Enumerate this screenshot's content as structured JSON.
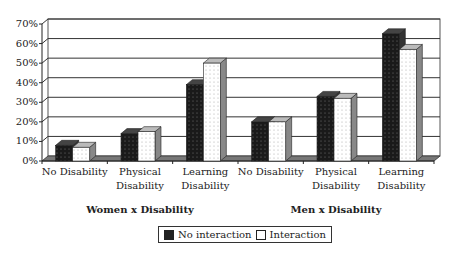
{
  "chart_data": {
    "type": "bar",
    "title": "",
    "xlabel": "",
    "ylabel": "",
    "ylim": [
      0,
      70
    ],
    "yticks": [
      "0%",
      "10%",
      "20%",
      "30%",
      "40%",
      "50%",
      "60%",
      "70%"
    ],
    "grid": true,
    "legend_position": "bottom",
    "categories": [
      "No Disability",
      "Physical Disability",
      "Learning Disability",
      "No Disability",
      "Physical Disability",
      "Learning Disability"
    ],
    "category_lines": [
      [
        "No Disability"
      ],
      [
        "Physical",
        "Disability"
      ],
      [
        "Learning",
        "Disability"
      ],
      [
        "No Disability"
      ],
      [
        "Physical",
        "Disability"
      ],
      [
        "Learning",
        "Disability"
      ]
    ],
    "groups": [
      "Women x Disability",
      "Men x Disability"
    ],
    "series": [
      {
        "name": "No interaction",
        "color": "#222222",
        "values": [
          8,
          14,
          39,
          20,
          33,
          65
        ]
      },
      {
        "name": "Interaction",
        "color": "#ffffff",
        "values": [
          7,
          15,
          50,
          20,
          32,
          57
        ]
      }
    ]
  },
  "legend": {
    "no_interaction": "No interaction",
    "interaction": "Interaction"
  }
}
